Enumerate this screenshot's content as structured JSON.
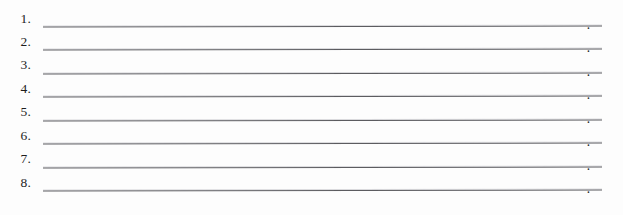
{
  "document": {
    "type": "worksheet-answer-lines",
    "background_color": "#fdfdfd",
    "rule_color": "#5c5c60",
    "text_color": "#1d1d1d",
    "line_terminator": ".",
    "rows": [
      {
        "number": "1.",
        "value": "",
        "terminator": "."
      },
      {
        "number": "2.",
        "value": "",
        "terminator": "."
      },
      {
        "number": "3.",
        "value": "",
        "terminator": "."
      },
      {
        "number": "4.",
        "value": "",
        "terminator": "."
      },
      {
        "number": "5.",
        "value": "",
        "terminator": "."
      },
      {
        "number": "6.",
        "value": "",
        "terminator": "."
      },
      {
        "number": "7.",
        "value": "",
        "terminator": "."
      },
      {
        "number": "8.",
        "value": "",
        "terminator": "."
      }
    ]
  }
}
